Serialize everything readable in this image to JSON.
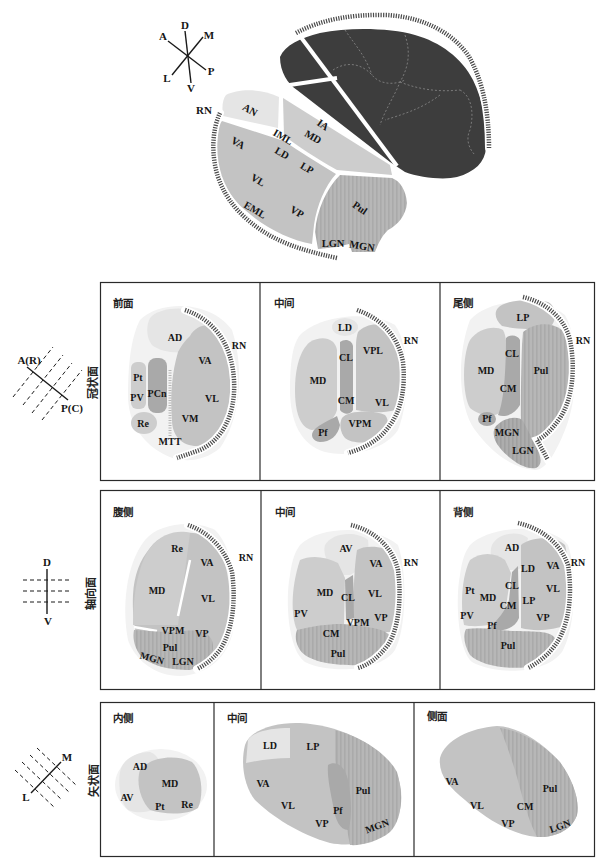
{
  "top_view": {
    "compass": [
      "D",
      "A",
      "M",
      "L",
      "P",
      "V"
    ],
    "rn": "RN",
    "labels": [
      "AN",
      "IA",
      "IML",
      "MD",
      "VA",
      "LD",
      "LP",
      "VL",
      "EML",
      "VP",
      "Pul",
      "LGN",
      "MGN"
    ]
  },
  "rows": [
    {
      "plane": "冠状面",
      "orientation": [
        "A(R)",
        "P(C)"
      ],
      "panels": [
        {
          "title": "前面",
          "rn": "RN",
          "labels": [
            "AD",
            "VA",
            "Pt",
            "PCn",
            "VL",
            "PV",
            "VM",
            "Re",
            "MTT"
          ]
        },
        {
          "title": "中间",
          "rn": "RN",
          "labels": [
            "LD",
            "VPL",
            "CL",
            "MD",
            "CM",
            "VL",
            "VPM",
            "Pf"
          ]
        },
        {
          "title": "尾侧",
          "rn": "RN",
          "labels": [
            "LP",
            "CL",
            "MD",
            "Pul",
            "CM",
            "Pf",
            "MGN",
            "LGN"
          ]
        }
      ]
    },
    {
      "plane": "轴向面",
      "orientation": [
        "D",
        "V"
      ],
      "panels": [
        {
          "title": "腹侧",
          "rn": "RN",
          "labels": [
            "Re",
            "VA",
            "MD",
            "VL",
            "VPM",
            "VP",
            "Pul",
            "MGN",
            "LGN"
          ]
        },
        {
          "title": "中间",
          "rn": "RN",
          "labels": [
            "AV",
            "VA",
            "MD",
            "CL",
            "VL",
            "PV",
            "VPM",
            "VP",
            "CM",
            "Pul"
          ]
        },
        {
          "title": "背侧",
          "rn": "RN",
          "labels": [
            "AD",
            "LD",
            "VA",
            "Pt",
            "CL",
            "MD",
            "VL",
            "CM",
            "LP",
            "PV",
            "VP",
            "Pf",
            "Pul"
          ]
        }
      ]
    },
    {
      "plane": "矢状面",
      "orientation": [
        "M",
        "L"
      ],
      "panels": [
        {
          "title": "内侧",
          "labels": [
            "AD",
            "MD",
            "AV",
            "Pt",
            "Re"
          ]
        },
        {
          "title": "中间",
          "labels": [
            "LD",
            "LP",
            "VA",
            "Pul",
            "VL",
            "Pf",
            "VP",
            "MGN"
          ]
        },
        {
          "title": "侧面",
          "labels": [
            "VA",
            "Pul",
            "VL",
            "CM",
            "VP",
            "LGN"
          ]
        }
      ]
    }
  ],
  "colors": {
    "dark_thalamus": "#3d3d3d",
    "light_nucleus": "#e5e5e5",
    "mid_nucleus": "#cdcdcd",
    "gray_nucleus": "#c3c3c3",
    "dark_nucleus": "#a9a9a9",
    "striped_nucleus": "#b5b5b5",
    "reticular_hatch": "#4a4a4a"
  }
}
